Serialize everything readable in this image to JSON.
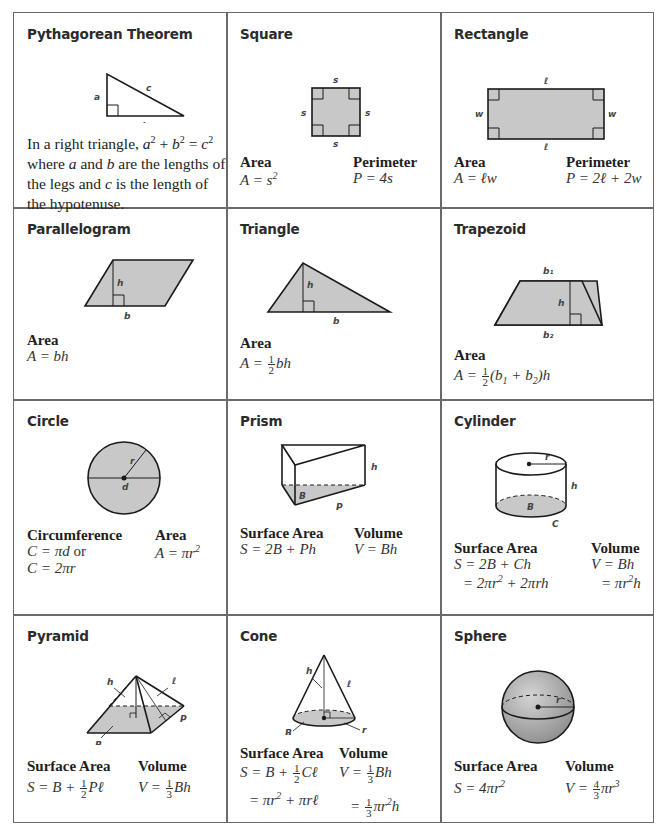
{
  "cells": {
    "pythagorean": {
      "title": "Pythagorean Theorem",
      "labels": {
        "a": "a",
        "b": "b",
        "c": "c"
      },
      "text": "In a right triangle, a² + b² = c² where a and b are the lengths of the legs and c is the length of the hypotenuse."
    },
    "square": {
      "title": "Square",
      "labels": {
        "side": "s"
      },
      "area_label": "Area",
      "area_formula": "A = s²",
      "perimeter_label": "Perimeter",
      "perimeter_formula": "P = 4s"
    },
    "rectangle": {
      "title": "Rectangle",
      "labels": {
        "length": "ℓ",
        "width": "w"
      },
      "area_label": "Area",
      "area_formula": "A = ℓw",
      "perimeter_label": "Perimeter",
      "perimeter_formula": "P = 2ℓ + 2w"
    },
    "parallelogram": {
      "title": "Parallelogram",
      "labels": {
        "height": "h",
        "base": "b"
      },
      "area_label": "Area",
      "area_formula": "A = bh"
    },
    "triangle": {
      "title": "Triangle",
      "labels": {
        "height": "h",
        "base": "b"
      },
      "area_label": "Area",
      "area_formula": "A = ½bh"
    },
    "trapezoid": {
      "title": "Trapezoid",
      "labels": {
        "b1": "b₁",
        "b2": "b₂",
        "height": "h"
      },
      "area_label": "Area",
      "area_formula": "A = ½(b₁ + b₂)h"
    },
    "circle": {
      "title": "Circle",
      "labels": {
        "radius": "r",
        "diameter": "d"
      },
      "circumference_label": "Circumference",
      "circumference_formula_1": "C = πd or",
      "circumference_formula_2": "C = 2πr",
      "area_label": "Area",
      "area_formula": "A = πr²"
    },
    "prism": {
      "title": "Prism",
      "labels": {
        "height": "h",
        "base": "B",
        "perimeter": "P"
      },
      "surface_area_label": "Surface Area",
      "surface_area_formula": "S = 2B + Ph",
      "volume_label": "Volume",
      "volume_formula": "V = Bh"
    },
    "cylinder": {
      "title": "Cylinder",
      "labels": {
        "radius": "r",
        "height": "h",
        "base": "B",
        "circumference": "C"
      },
      "surface_area_label": "Surface Area",
      "surface_area_formula_1": "S = 2B + Ch",
      "surface_area_formula_2": "= 2πr² + 2πrh",
      "volume_label": "Volume",
      "volume_formula_1": "V = Bh",
      "volume_formula_2": "= πr²h"
    },
    "pyramid": {
      "title": "Pyramid",
      "labels": {
        "height": "h",
        "slant": "ℓ",
        "base": "B",
        "perimeter": "P"
      },
      "surface_area_label": "Surface Area",
      "surface_area_formula": "S = B + ½Pℓ",
      "volume_label": "Volume",
      "volume_formula": "V = ⅓Bh"
    },
    "cone": {
      "title": "Cone",
      "labels": {
        "height": "h",
        "slant": "ℓ",
        "base": "B",
        "radius": "r"
      },
      "surface_area_label": "Surface Area",
      "surface_area_formula_1": "S = B + ½Cℓ",
      "surface_area_formula_2": "= πr² + πrℓ",
      "volume_label": "Volume",
      "volume_formula_1": "V = ⅓Bh",
      "volume_formula_2": "= ⅓πr²h"
    },
    "sphere": {
      "title": "Sphere",
      "labels": {
        "radius": "r"
      },
      "surface_area_label": "Surface Area",
      "surface_area_formula": "S = 4πr²",
      "volume_label": "Volume",
      "volume_formula": "V = 4/3 πr³"
    }
  },
  "colors": {
    "fill": "#c8c8c8",
    "stroke": "#1a1a1a",
    "grid": "#6a6a6a"
  }
}
